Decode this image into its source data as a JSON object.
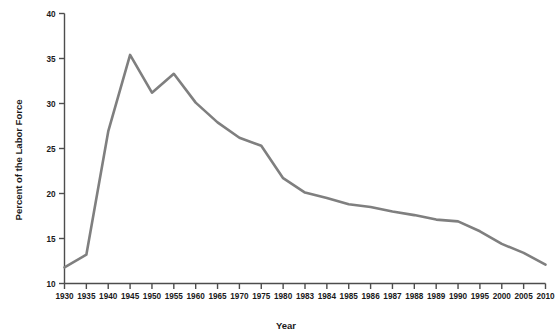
{
  "chart_data": {
    "type": "line",
    "title": "",
    "xlabel": "Year",
    "ylabel": "Percent of the Labor Force",
    "grid": false,
    "legend": "none",
    "xlim": [
      1930,
      2010
    ],
    "ylim": [
      10,
      40
    ],
    "ytick_labels": [
      "40",
      "35",
      "30",
      "25",
      "20",
      "15",
      "10"
    ],
    "ytick_values": [
      40,
      35,
      30,
      25,
      20,
      15,
      10
    ],
    "categories": [
      "1930",
      "1935",
      "1940",
      "1945",
      "1950",
      "1955",
      "1960",
      "1965",
      "1970",
      "1975",
      "1980",
      "1983",
      "1984",
      "1985",
      "1986",
      "1987",
      "1988",
      "1989",
      "1990",
      "1995",
      "2000",
      "2005",
      "2010"
    ],
    "values": [
      11.8,
      13.2,
      26.9,
      35.4,
      31.2,
      33.3,
      30.1,
      27.9,
      26.2,
      25.3,
      21.7,
      20.1,
      19.5,
      18.8,
      18.5,
      18.0,
      17.6,
      17.1,
      16.9,
      15.8,
      14.4,
      13.4,
      12.1
    ],
    "series": [
      {
        "name": "Percent of the Labor Force",
        "color": "#7f7f7f",
        "values": [
          11.8,
          13.2,
          26.9,
          35.4,
          31.2,
          33.3,
          30.1,
          27.9,
          26.2,
          25.3,
          21.7,
          20.1,
          19.5,
          18.8,
          18.5,
          18.0,
          17.6,
          17.1,
          16.9,
          15.8,
          14.4,
          13.4,
          12.1
        ]
      }
    ],
    "axis_color": "#4d4d4d",
    "line_color": "#7f7f7f",
    "background_color": "#ffffff"
  }
}
